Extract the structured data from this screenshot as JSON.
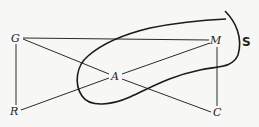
{
  "diagram": {
    "nodes": [
      {
        "id": "G",
        "label": "G",
        "x": 16,
        "y": 41
      },
      {
        "id": "R",
        "label": "R",
        "x": 14,
        "y": 115
      },
      {
        "id": "A",
        "label": "A",
        "x": 115,
        "y": 80
      },
      {
        "id": "M",
        "label": "M",
        "x": 216,
        "y": 44
      },
      {
        "id": "C",
        "label": "C",
        "x": 217,
        "y": 116
      }
    ],
    "edges": [
      {
        "from": "G",
        "to": "M"
      },
      {
        "from": "G",
        "to": "R"
      },
      {
        "from": "G",
        "to": "C",
        "via": "A"
      },
      {
        "from": "R",
        "to": "M",
        "via": "A"
      },
      {
        "from": "M",
        "to": "C"
      }
    ],
    "set_label": "S"
  }
}
